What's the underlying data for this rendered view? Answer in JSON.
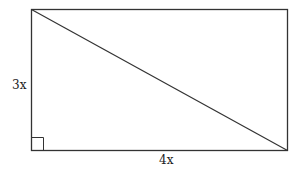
{
  "diagram": {
    "type": "rectangle-with-diagonal",
    "labels": {
      "left_side": "3x",
      "bottom_side": "4x"
    },
    "right_angle_marker": "bottom-left",
    "colors": {
      "stroke": "#333333",
      "background": "#ffffff"
    }
  }
}
